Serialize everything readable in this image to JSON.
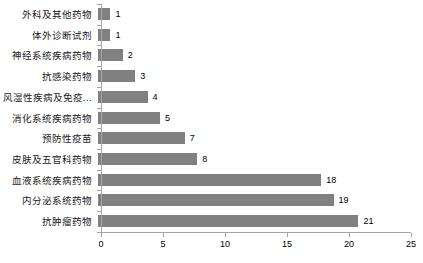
{
  "chart_data": {
    "type": "bar",
    "orientation": "horizontal",
    "title": "",
    "subtitle": "",
    "xlabel": "",
    "ylabel": "",
    "xlim": [
      0,
      25
    ],
    "xticks": [
      "0",
      "5",
      "10",
      "15",
      "20",
      "25"
    ],
    "xtick_values": [
      0,
      5,
      10,
      15,
      20,
      25
    ],
    "grid": false,
    "legend": "none",
    "bar_color": "#808080",
    "axis_color": "#a6a6a6",
    "text_color": "#000000",
    "categories": [
      "外科及其他药物",
      "体外诊断试剂",
      "神经系统疾病药物",
      "抗感染药物",
      "风湿性疾病及免疫…",
      "消化系统疾病药物",
      "预防性疫苗",
      "皮肤及五官科药物",
      "血液系统疾病药物",
      "内分泌系统药物",
      "抗肿瘤药物"
    ],
    "values": [
      1,
      1,
      2,
      3,
      4,
      5,
      7,
      8,
      18,
      19,
      21
    ],
    "data_labels": [
      "1",
      "1",
      "2",
      "3",
      "4",
      "5",
      "7",
      "8",
      "18",
      "19",
      "21"
    ]
  }
}
